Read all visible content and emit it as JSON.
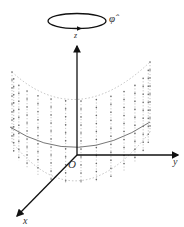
{
  "diagram": {
    "type": "3d-coordinate-cylinder",
    "labels": {
      "phi": "φ̂",
      "z": "z",
      "y": "y",
      "x": "x",
      "origin": "O"
    },
    "colors": {
      "axis": "#111111",
      "grid": "#9a9a9a",
      "dots": "#666666",
      "arc": "#777777",
      "loop": "#111111",
      "text": "#333333"
    },
    "geometry": {
      "origin": [
        77,
        155
      ],
      "z_axis_tip": [
        77,
        43
      ],
      "y_axis_tip": [
        181,
        155
      ],
      "x_axis_tip": [
        15,
        218
      ],
      "loop": {
        "cx": 77,
        "cy": 21,
        "rx": 29,
        "ry": 7.5
      },
      "cylinder": {
        "columns": 15,
        "top_left": [
          12,
          72
        ],
        "top_center_y": 101,
        "top_right": [
          150,
          62
        ],
        "height": 70,
        "dot_spacing": 8
      },
      "arc": {
        "left": [
          10,
          127
        ],
        "bottom": [
          77,
          148
        ],
        "right": [
          150,
          122
        ]
      }
    }
  }
}
